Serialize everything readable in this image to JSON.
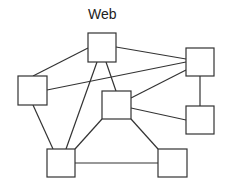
{
  "diagram": {
    "title": "Web",
    "stroke_color": "#333333",
    "background": "#ffffff",
    "nodes": [
      {
        "id": "top",
        "x": 88,
        "y": 33,
        "w": 28,
        "h": 29,
        "label": ""
      },
      {
        "id": "left",
        "x": 18,
        "y": 76,
        "w": 29,
        "h": 29,
        "label": ""
      },
      {
        "id": "middle",
        "x": 102,
        "y": 91,
        "w": 29,
        "h": 28,
        "label": ""
      },
      {
        "id": "right-top",
        "x": 186,
        "y": 48,
        "w": 28,
        "h": 28,
        "label": ""
      },
      {
        "id": "right-bottom",
        "x": 186,
        "y": 106,
        "w": 28,
        "h": 28,
        "label": ""
      },
      {
        "id": "bottom-left",
        "x": 47,
        "y": 149,
        "w": 28,
        "h": 28,
        "label": ""
      },
      {
        "id": "bottom-right",
        "x": 158,
        "y": 149,
        "w": 29,
        "h": 28,
        "label": ""
      }
    ],
    "edges": [
      {
        "from": "top",
        "to": "left",
        "x1": 88,
        "y1": 48,
        "x2": 33,
        "y2": 76
      },
      {
        "from": "top",
        "to": "right-top",
        "x1": 116,
        "y1": 47,
        "x2": 186,
        "y2": 59
      },
      {
        "from": "top",
        "to": "bottom-left",
        "x1": 97,
        "y1": 62,
        "x2": 66,
        "y2": 149
      },
      {
        "from": "top",
        "to": "middle",
        "x1": 106,
        "y1": 62,
        "x2": 116,
        "y2": 91
      },
      {
        "from": "left",
        "to": "right-top",
        "x1": 47,
        "y1": 90,
        "x2": 186,
        "y2": 62
      },
      {
        "from": "left",
        "to": "bottom-left",
        "x1": 33,
        "y1": 105,
        "x2": 53,
        "y2": 149
      },
      {
        "from": "middle",
        "to": "right-top",
        "x1": 131,
        "y1": 98,
        "x2": 186,
        "y2": 70
      },
      {
        "from": "middle",
        "to": "right-bottom",
        "x1": 131,
        "y1": 108,
        "x2": 186,
        "y2": 120
      },
      {
        "from": "middle",
        "to": "bottom-left",
        "x1": 102,
        "y1": 119,
        "x2": 75,
        "y2": 149
      },
      {
        "from": "middle",
        "to": "bottom-right",
        "x1": 131,
        "y1": 119,
        "x2": 158,
        "y2": 149
      },
      {
        "from": "right-top",
        "to": "right-bottom",
        "x1": 200,
        "y1": 76,
        "x2": 200,
        "y2": 106
      },
      {
        "from": "bottom-left",
        "to": "bottom-right",
        "x1": 75,
        "y1": 163,
        "x2": 158,
        "y2": 163
      }
    ]
  }
}
